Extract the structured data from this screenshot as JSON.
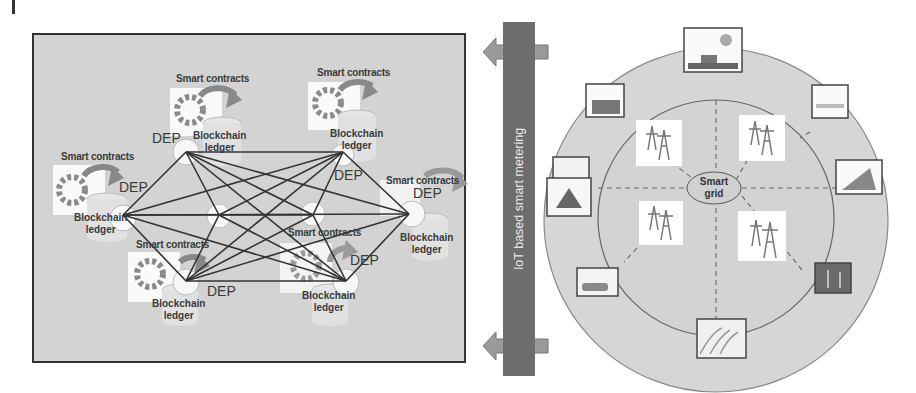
{
  "blockchain_network": {
    "nodes": [
      {
        "id": "n1",
        "smart_contracts": "Smart contracts",
        "dep": "DEP",
        "ledger_line1": "Blockchain",
        "ledger_line2": "ledger"
      },
      {
        "id": "n2",
        "smart_contracts": "Smart contracts",
        "dep": "DEP",
        "ledger_line1": "Blockchain",
        "ledger_line2": "ledger"
      },
      {
        "id": "n3",
        "smart_contracts": "Smart contracts",
        "dep": "DEP",
        "ledger_line1": "Blockchain",
        "ledger_line2": "ledger"
      },
      {
        "id": "n4",
        "smart_contracts": "Smart contracts",
        "dep": "DEP",
        "ledger_line1": "Blockchain",
        "ledger_line2": "ledger"
      },
      {
        "id": "n5",
        "smart_contracts": "Smart contracts",
        "dep": "DEP",
        "ledger_line1": "Blockchain",
        "ledger_line2": "ledger"
      },
      {
        "id": "n6",
        "smart_contracts": "Smart contracts",
        "dep": "DEP",
        "ledger_line1": "Blockchain",
        "ledger_line2": "ledger"
      }
    ]
  },
  "metering_bar": {
    "label": "IoT based smart metering"
  },
  "smart_grid": {
    "center_line1": "Smart",
    "center_line2": "grid",
    "inner_icons": [
      "transmission-tower",
      "transmission-tower",
      "transmission-tower",
      "transmission-tower"
    ],
    "outer_icons": [
      "power-plant",
      "factory",
      "solar-field",
      "hydro-dam",
      "wind-turbines",
      "electric-vehicle",
      "smart-home",
      "solar-panels"
    ]
  },
  "colors": {
    "panel_bg": "#d3d3d3",
    "bar_bg": "#6d6d6d",
    "circle_bg": "#d6d6d6",
    "arrow": "#9a9a9a",
    "line": "#333333"
  }
}
